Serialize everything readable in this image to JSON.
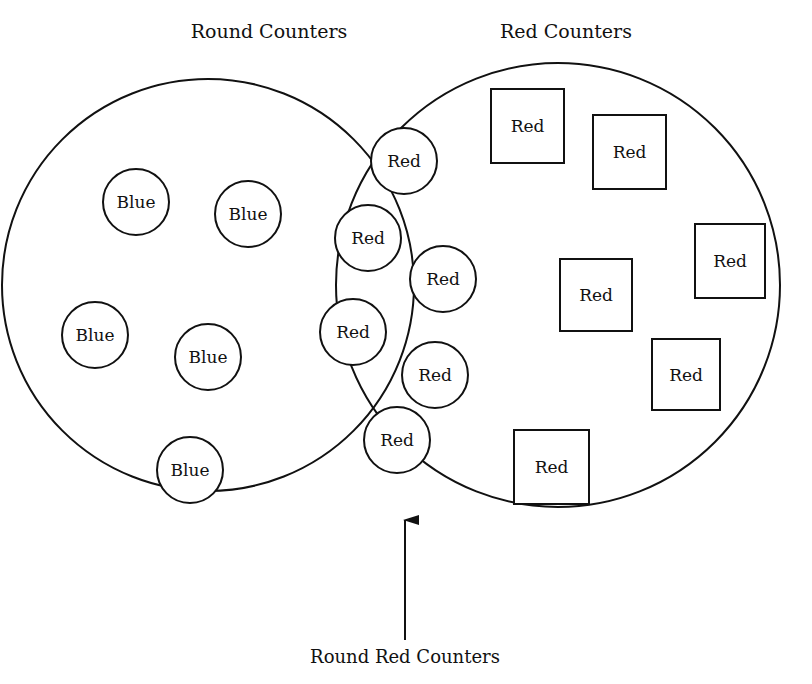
{
  "diagram": {
    "type": "venn",
    "colors": {
      "stroke": "#111111",
      "background": "#ffffff"
    },
    "sets": [
      {
        "id": "round",
        "label": "Round Counters",
        "cx": 208,
        "cy": 285,
        "r": 206,
        "label_x": 269,
        "label_y": 38
      },
      {
        "id": "red",
        "label": "Red Counters",
        "cx": 558,
        "cy": 285,
        "r": 222,
        "label_x": 566,
        "label_y": 38
      }
    ],
    "intersection": {
      "label": "Round Red Counters",
      "label_x": 405,
      "label_y": 663,
      "arrow": {
        "x": 405,
        "y_from": 640,
        "y_to": 520
      }
    },
    "counters": [
      {
        "shape": "circle",
        "text": "Blue",
        "region": "round-only",
        "x": 136,
        "y": 202,
        "r": 33
      },
      {
        "shape": "circle",
        "text": "Blue",
        "region": "round-only",
        "x": 248,
        "y": 214,
        "r": 33
      },
      {
        "shape": "circle",
        "text": "Blue",
        "region": "round-only",
        "x": 95,
        "y": 335,
        "r": 33
      },
      {
        "shape": "circle",
        "text": "Blue",
        "region": "round-only",
        "x": 208,
        "y": 357,
        "r": 33
      },
      {
        "shape": "circle",
        "text": "Blue",
        "region": "round-only",
        "x": 190,
        "y": 470,
        "r": 33
      },
      {
        "shape": "circle",
        "text": "Red",
        "region": "both",
        "x": 404,
        "y": 161,
        "r": 33
      },
      {
        "shape": "circle",
        "text": "Red",
        "region": "both",
        "x": 368,
        "y": 238,
        "r": 33
      },
      {
        "shape": "circle",
        "text": "Red",
        "region": "both",
        "x": 443,
        "y": 279,
        "r": 33
      },
      {
        "shape": "circle",
        "text": "Red",
        "region": "both",
        "x": 353,
        "y": 332,
        "r": 33
      },
      {
        "shape": "circle",
        "text": "Red",
        "region": "both",
        "x": 435,
        "y": 375,
        "r": 33
      },
      {
        "shape": "circle",
        "text": "Red",
        "region": "both",
        "x": 397,
        "y": 440,
        "r": 33
      },
      {
        "shape": "square",
        "text": "Red",
        "region": "red-only",
        "x": 491,
        "y": 89,
        "w": 73,
        "h": 74
      },
      {
        "shape": "square",
        "text": "Red",
        "region": "red-only",
        "x": 593,
        "y": 115,
        "w": 73,
        "h": 74
      },
      {
        "shape": "square",
        "text": "Red",
        "region": "red-only",
        "x": 695,
        "y": 224,
        "w": 70,
        "h": 74
      },
      {
        "shape": "square",
        "text": "Red",
        "region": "red-only",
        "x": 560,
        "y": 259,
        "w": 72,
        "h": 72
      },
      {
        "shape": "square",
        "text": "Red",
        "region": "red-only",
        "x": 652,
        "y": 339,
        "w": 68,
        "h": 71
      },
      {
        "shape": "square",
        "text": "Red",
        "region": "red-only",
        "x": 514,
        "y": 430,
        "w": 75,
        "h": 74
      }
    ]
  }
}
